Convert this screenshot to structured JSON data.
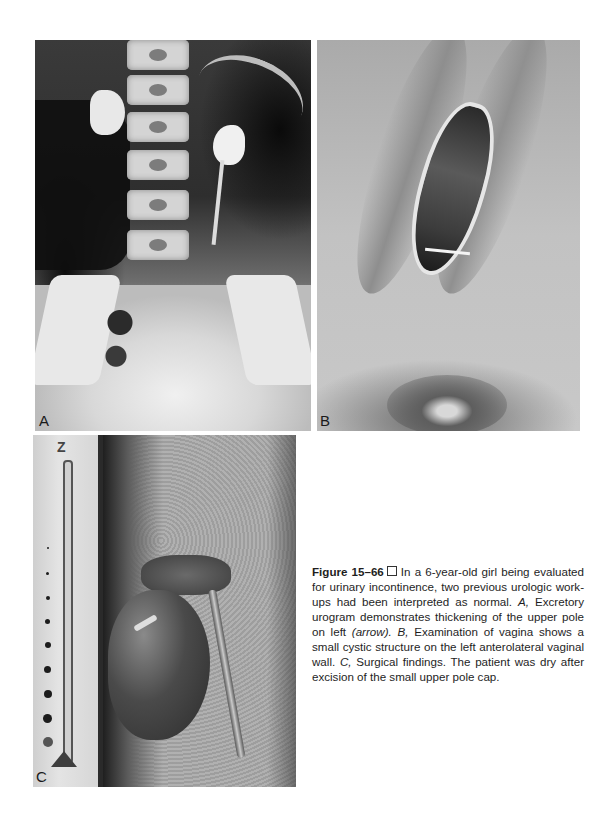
{
  "figure": {
    "panels": [
      {
        "label": "A",
        "description": "Excretory urogram (X-ray)"
      },
      {
        "label": "B",
        "description": "Clinical photograph of vaginal examination"
      },
      {
        "label": "C",
        "description": "Surgical findings photograph with ruler"
      }
    ],
    "caption": {
      "figure_number": "Figure 15–66",
      "symbol": "box",
      "intro": "In a 6-year-old girl being evaluated for urinary incontinence, two previous urologic work-ups had been interpreted as normal. ",
      "a_label": "A,",
      "a_text": " Excretory urogram demonstrates thickening of the upper pole on left ",
      "a_arrow": "(arrow).",
      "b_label": " B,",
      "b_text": " Examination of vagina shows a small cystic structure on the left anterolateral vaginal wall. ",
      "c_label": "C,",
      "c_text": " Surgical findings. The patient was dry after excision of the small upper pole cap."
    },
    "ruler_mark": "Z"
  }
}
